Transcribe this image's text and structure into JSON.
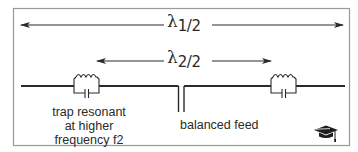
{
  "diagram": {
    "outer_span": {
      "symbol": "λ",
      "fraction": "1/2",
      "description": "half wavelength at lower frequency f1"
    },
    "inner_span": {
      "symbol": "λ",
      "fraction": "2/2",
      "description": "half wavelength at higher frequency f2"
    },
    "labels": {
      "trap_line1": "trap resonant",
      "trap_line2": "at higher",
      "trap_line3": "frequency f2",
      "feed": "balanced feed"
    },
    "components": [
      "left-trap",
      "right-trap",
      "balanced-feed-point"
    ],
    "icons": {
      "corner": "graduation-cap-icon"
    },
    "colors": {
      "line": "#2a2a2a",
      "frame": "#9a9a9a",
      "background": "#ffffff"
    }
  }
}
